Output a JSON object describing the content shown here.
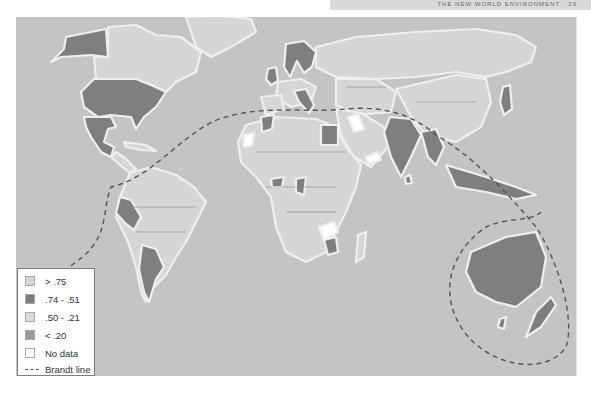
{
  "header": {
    "running_text": "THE NEW WORLD ENVIRONMENT · 29"
  },
  "map": {
    "title": "",
    "ocean_color": "#c4c4c4",
    "border_color": "#8a8a8a",
    "coast_halo_color": "#efefef",
    "brandt_line_color": "#555555",
    "categories": {
      "gt_75": {
        "label": "> .75",
        "color": "#d6d6d6"
      },
      "c74_51": {
        "label": ".74 - .51",
        "color": "#7f7f7f"
      },
      "c50_21": {
        "label": ".50 - .21",
        "color": "#dcdcdc"
      },
      "lt_20": {
        "label": "< .20",
        "color": "#9a9a9a"
      },
      "no_data": {
        "label": "No data",
        "color": "#ffffff"
      }
    },
    "regions": [
      {
        "name": "Alaska",
        "category": "c74_51"
      },
      {
        "name": "Canada",
        "category": "gt_75"
      },
      {
        "name": "Greenland",
        "category": "gt_75"
      },
      {
        "name": "United States",
        "category": "c74_51"
      },
      {
        "name": "Mexico",
        "category": "c74_51"
      },
      {
        "name": "Central America & Caribbean",
        "category": "gt_75"
      },
      {
        "name": "Peru",
        "category": "c74_51"
      },
      {
        "name": "Argentina",
        "category": "c74_51"
      },
      {
        "name": "Rest of South America",
        "category": "gt_75"
      },
      {
        "name": "Scandinavia",
        "category": "c74_51"
      },
      {
        "name": "United Kingdom",
        "category": "c74_51"
      },
      {
        "name": "Italy",
        "category": "c74_51"
      },
      {
        "name": "Russia / Northern Asia",
        "category": "gt_75"
      },
      {
        "name": "Egypt",
        "category": "c74_51"
      },
      {
        "name": "Morocco",
        "category": "c74_51"
      },
      {
        "name": "India",
        "category": "c74_51"
      },
      {
        "name": "China",
        "category": "gt_75"
      },
      {
        "name": "Japan",
        "category": "c74_51"
      },
      {
        "name": "Southeast Asia",
        "category": "c74_51"
      },
      {
        "name": "Indonesia",
        "category": "c74_51"
      },
      {
        "name": "Australia",
        "category": "c74_51"
      },
      {
        "name": "New Zealand",
        "category": "c74_51"
      },
      {
        "name": "Africa (most)",
        "category": "gt_75"
      },
      {
        "name": "Zimbabwe",
        "category": "c74_51"
      },
      {
        "name": "Zambia",
        "category": "no_data"
      },
      {
        "name": "Iraq",
        "category": "no_data"
      },
      {
        "name": "Western Sahara",
        "category": "no_data"
      },
      {
        "name": "Yemen",
        "category": "no_data"
      }
    ]
  },
  "legend": {
    "items": [
      {
        "label": "> .75",
        "swatch": "#d6d6d6",
        "type": "box"
      },
      {
        "label": ".74 - .51",
        "swatch": "#7f7f7f",
        "type": "box"
      },
      {
        "label": ".50 - .21",
        "swatch": "#dcdcdc",
        "type": "box"
      },
      {
        "label": "< .20",
        "swatch": "#9a9a9a",
        "type": "box"
      },
      {
        "label": "No data",
        "swatch": "#ffffff",
        "type": "box"
      },
      {
        "label": "Brandt line",
        "swatch": "#555555",
        "type": "dash"
      }
    ]
  }
}
